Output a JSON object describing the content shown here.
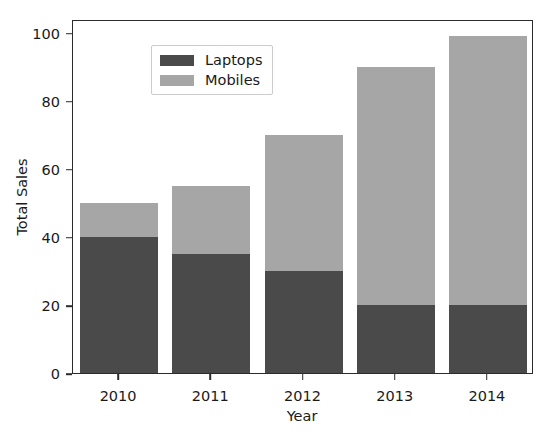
{
  "chart_data": {
    "type": "bar",
    "subtype": "stacked-vertical",
    "title": "",
    "xlabel": "Year",
    "ylabel": "Total Sales",
    "categories": [
      "2010",
      "2011",
      "2012",
      "2013",
      "2014"
    ],
    "series": [
      {
        "name": "Laptops",
        "color": "#4a4a4a",
        "values": [
          40,
          35,
          30,
          20,
          20
        ]
      },
      {
        "name": "Mobiles",
        "color": "#a6a6a6",
        "values": [
          10,
          20,
          40,
          70,
          79
        ]
      }
    ],
    "totals": [
      50,
      55,
      70,
      90,
      99
    ],
    "ylim": [
      0,
      104
    ],
    "yticks": [
      0,
      20,
      40,
      60,
      80,
      100
    ],
    "ytick_labels": [
      "0",
      "20",
      "40",
      "60",
      "80",
      "100"
    ],
    "xtick_labels": [
      "2010",
      "2011",
      "2012",
      "2013",
      "2014"
    ],
    "grid": false,
    "legend_position": "upper left",
    "legend_entries": [
      "Laptops",
      "Mobiles"
    ]
  },
  "axes": {
    "y_title": "Total Sales",
    "x_title": "Year"
  },
  "legend": {
    "items": [
      {
        "label": "Laptops",
        "color": "#4a4a4a"
      },
      {
        "label": "Mobiles",
        "color": "#a6a6a6"
      }
    ]
  },
  "ghost_title": ""
}
